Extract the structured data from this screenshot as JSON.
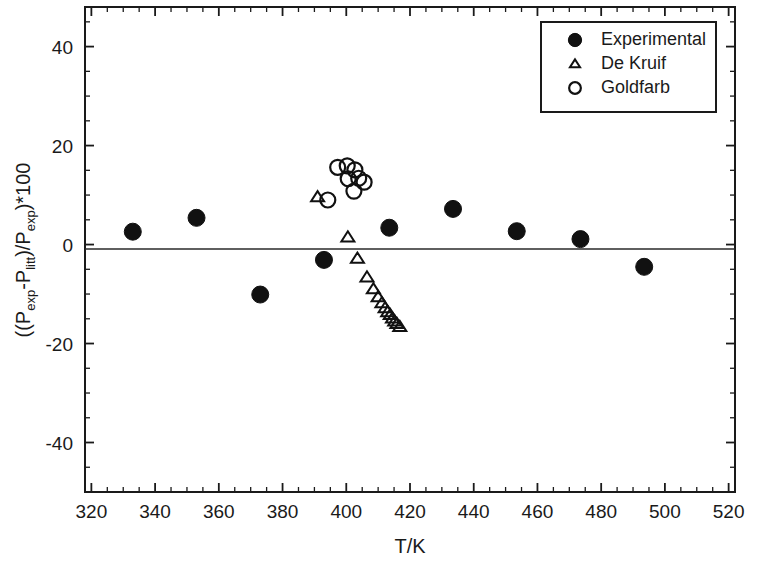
{
  "chart_data": {
    "type": "scatter",
    "title": "",
    "xlabel": "T/K",
    "ylabel": "((Pexp-Plitt)/Pexp)*100",
    "ylabel_parts": [
      {
        "text": "((P",
        "sub": false
      },
      {
        "text": "exp",
        "sub": true
      },
      {
        "text": "-P",
        "sub": false
      },
      {
        "text": "litt",
        "sub": true
      },
      {
        "text": ")/P",
        "sub": false
      },
      {
        "text": "exp",
        "sub": true
      },
      {
        "text": ")*100",
        "sub": false
      }
    ],
    "xlim": [
      318,
      522
    ],
    "ylim": [
      -50,
      48
    ],
    "x_major_ticks": [
      320,
      340,
      360,
      380,
      400,
      420,
      440,
      460,
      480,
      500,
      520
    ],
    "x_tick_labels": [
      "320",
      "340",
      "360",
      "380",
      "400",
      "420",
      "440",
      "460",
      "480",
      "500",
      "520"
    ],
    "x_minor_step": 5,
    "y_major_ticks": [
      -40,
      -20,
      0,
      20,
      40
    ],
    "y_tick_labels": [
      "-40",
      "-20",
      "0",
      "20",
      "40"
    ],
    "y_minor_step": 5,
    "grid": false,
    "zero_line": true,
    "legend_position": "top-right",
    "series": [
      {
        "name": "Experimental",
        "marker": "filled-circle",
        "color": "#111111",
        "points": [
          {
            "x": 333,
            "y": 2.6
          },
          {
            "x": 353,
            "y": 5.4
          },
          {
            "x": 373,
            "y": -10.1
          },
          {
            "x": 393,
            "y": -3.1
          },
          {
            "x": 413.5,
            "y": 3.4
          },
          {
            "x": 433.5,
            "y": 7.2
          },
          {
            "x": 453.5,
            "y": 2.7
          },
          {
            "x": 473.5,
            "y": 1.1
          },
          {
            "x": 493.5,
            "y": -4.5
          }
        ]
      },
      {
        "name": "De Kruif",
        "marker": "open-triangle",
        "color": "#111111",
        "points": [
          {
            "x": 391.0,
            "y": 9.6
          },
          {
            "x": 400.5,
            "y": 1.5
          },
          {
            "x": 403.5,
            "y": -2.8
          },
          {
            "x": 406.5,
            "y": -6.6
          },
          {
            "x": 408.5,
            "y": -9.0
          },
          {
            "x": 410.0,
            "y": -10.6
          },
          {
            "x": 411.2,
            "y": -11.8
          },
          {
            "x": 412.2,
            "y": -12.8
          },
          {
            "x": 413.0,
            "y": -13.6
          },
          {
            "x": 413.8,
            "y": -14.2
          },
          {
            "x": 414.5,
            "y": -14.9
          },
          {
            "x": 415.2,
            "y": -15.5
          },
          {
            "x": 415.9,
            "y": -16.0
          },
          {
            "x": 416.8,
            "y": -16.6
          }
        ]
      },
      {
        "name": "Goldfarb",
        "marker": "open-circle",
        "color": "#111111",
        "points": [
          {
            "x": 394.2,
            "y": 9.0
          },
          {
            "x": 397.3,
            "y": 15.6
          },
          {
            "x": 400.3,
            "y": 15.9
          },
          {
            "x": 402.7,
            "y": 15.1
          },
          {
            "x": 400.6,
            "y": 13.3
          },
          {
            "x": 403.9,
            "y": 13.4
          },
          {
            "x": 402.4,
            "y": 10.8
          },
          {
            "x": 405.6,
            "y": 12.6
          }
        ]
      }
    ]
  },
  "legend": {
    "items": [
      {
        "label": "Experimental",
        "marker": "filled-circle"
      },
      {
        "label": "De Kruif",
        "marker": "open-triangle"
      },
      {
        "label": "Goldfarb",
        "marker": "open-circle"
      }
    ]
  },
  "style": {
    "axis_color": "#1a1a1a",
    "marker_color": "#111111",
    "background": "#ffffff"
  }
}
